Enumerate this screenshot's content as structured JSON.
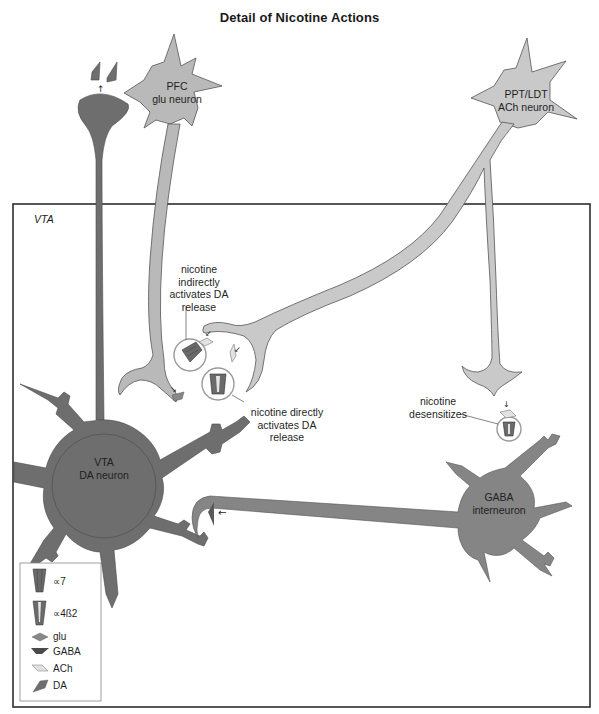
{
  "title": "Detail of Nicotine Actions",
  "region_label": "VTA",
  "neurons": {
    "pfc": {
      "line1": "PFC",
      "line2": "glu neuron"
    },
    "ppt_ldt": {
      "line1": "PPT/LDT",
      "line2": "ACh neuron"
    },
    "vta_da": {
      "line1": "VTA",
      "line2": "DA neuron"
    },
    "gaba": {
      "line1": "GABA",
      "line2": "interneuron"
    }
  },
  "annotations": {
    "indirect": {
      "line1": "nicotine",
      "line2": "indirectly",
      "line3": "activates DA",
      "line4": "release"
    },
    "direct": {
      "line1": "nicotine directly",
      "line2": "activates DA",
      "line3": "release"
    },
    "desensitizes": {
      "line1": "nicotine",
      "line2": "desensitizes"
    }
  },
  "legend": {
    "items": [
      {
        "icon": "alpha7-receptor-icon",
        "label": "∝7"
      },
      {
        "icon": "alpha4beta2-receptor-icon",
        "label": "∝4ß2"
      },
      {
        "icon": "glu-icon",
        "label": "glu"
      },
      {
        "icon": "gaba-icon",
        "label": "GABA"
      },
      {
        "icon": "ach-icon",
        "label": "ACh"
      },
      {
        "icon": "da-icon",
        "label": "DA"
      }
    ]
  },
  "colors": {
    "da_neuron": "#6e6e6e",
    "glu_neuron": "#b9b9b9",
    "ach_neuron": "#c9c9c9",
    "gaba_neuron": "#858585",
    "outline": "#4a4a4a",
    "box_border": "#2e2e2e",
    "background": "#ffffff"
  }
}
